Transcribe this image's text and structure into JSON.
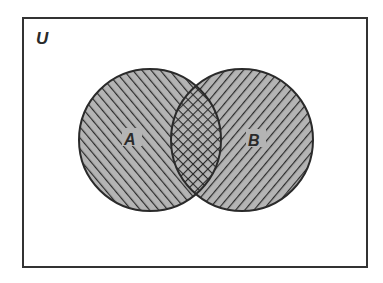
{
  "diagram": {
    "type": "venn",
    "universe": {
      "label": "U",
      "frame": {
        "x": 23,
        "y": 18,
        "width": 344,
        "height": 249
      }
    },
    "sets": [
      {
        "id": "A",
        "label": "A",
        "cx": 150,
        "cy": 140,
        "r": 71,
        "hatch": "forward-diagonal"
      },
      {
        "id": "B",
        "label": "B",
        "cx": 242,
        "cy": 140,
        "r": 71,
        "hatch": "backward-diagonal"
      }
    ],
    "intersection": {
      "label": "A ∩ B",
      "hatch": "cross-hatch"
    },
    "colors": {
      "frame_stroke": "#333333",
      "circle_stroke": "#2a2a2a",
      "fill": "#b4b4b4",
      "hatch": "#2a2a2a",
      "background": "#ffffff"
    }
  }
}
